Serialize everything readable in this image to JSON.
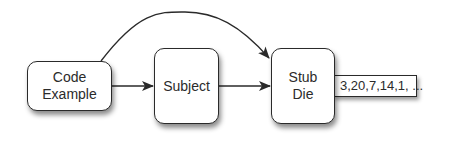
{
  "diagram": {
    "type": "flow",
    "nodes": [
      {
        "id": "code-example",
        "label": "Code\nExample"
      },
      {
        "id": "subject",
        "label": "Subject"
      },
      {
        "id": "stub-die",
        "label": "Stub\nDie"
      }
    ],
    "output": {
      "attached_to": "stub-die",
      "label": "3,20,7,14,1, ..."
    },
    "edges": [
      {
        "from": "code-example",
        "to": "subject",
        "style": "straight"
      },
      {
        "from": "subject",
        "to": "stub-die",
        "style": "straight"
      },
      {
        "from": "code-example",
        "to": "stub-die",
        "style": "curved"
      }
    ],
    "colors": {
      "stroke": "#2a2a2a",
      "text": "#2b2b2b",
      "fill": "#ffffff",
      "background": "#ffffff"
    }
  }
}
